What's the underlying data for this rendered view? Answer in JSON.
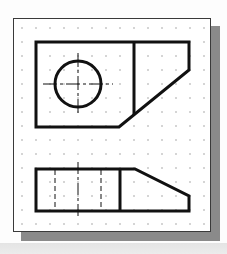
{
  "diagram": {
    "type": "orthographic-projection",
    "views": [
      {
        "name": "top-view",
        "features": [
          "rectangular-block",
          "circular-hole",
          "center-lines",
          "chamfered-corner"
        ]
      },
      {
        "name": "front-view",
        "features": [
          "rectangular-block",
          "hidden-lines",
          "center-line",
          "sloped-face"
        ]
      }
    ],
    "grid": {
      "type": "dot-grid",
      "spacing_px": 14
    },
    "colors": {
      "line": "#111111",
      "grid_dot": "#8a8a8a",
      "sheet": "#ffffff",
      "shadow": "#8a8a8a"
    }
  }
}
